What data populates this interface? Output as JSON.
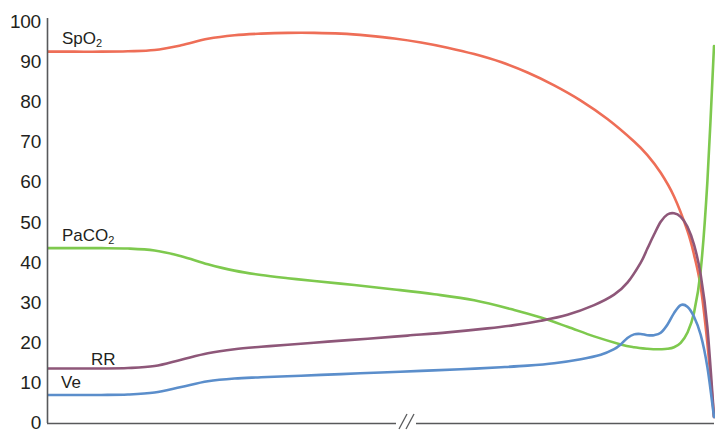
{
  "chart_data": {
    "type": "line",
    "title": "",
    "xlabel": "",
    "ylabel": "",
    "ylim": [
      0,
      100
    ],
    "xlim": [
      0,
      100
    ],
    "grid": false,
    "legend_position": "inline-curve-labels",
    "axis_break": {
      "present": true,
      "symbol": "//",
      "axis": "x",
      "x_position": 56
    },
    "y_ticks": [
      {
        "value": 100,
        "label": "100"
      },
      {
        "value": 90,
        "label": "90"
      },
      {
        "value": 80,
        "label": "80"
      },
      {
        "value": 70,
        "label": "70"
      },
      {
        "value": 60,
        "label": "60"
      },
      {
        "value": 50,
        "label": "50"
      },
      {
        "value": 40,
        "label": "40"
      },
      {
        "value": 30,
        "label": "30"
      },
      {
        "value": 20,
        "label": "20"
      },
      {
        "value": 10,
        "label": "10"
      },
      {
        "value": 0,
        "label": "0"
      }
    ],
    "x_ticks": [],
    "series": [
      {
        "name": "SpO2",
        "label": "SpO",
        "label_sub": "2",
        "color": "#ee6e57",
        "label_x": 62,
        "label_y": 30,
        "x": [
          0,
          4,
          8,
          12,
          16,
          20,
          24,
          28,
          32,
          36,
          40,
          44,
          48,
          52,
          56,
          60,
          64,
          68,
          72,
          76,
          80,
          84,
          88,
          90,
          92,
          94,
          96,
          97,
          98,
          99,
          100
        ],
        "y": [
          92.6,
          92.6,
          92.6,
          92.7,
          93.0,
          94.2,
          95.8,
          96.7,
          97.1,
          97.3,
          97.3,
          97.1,
          96.6,
          95.9,
          94.9,
          93.6,
          92.0,
          90.0,
          87.4,
          84.2,
          80.4,
          75.8,
          70.2,
          66.8,
          62.4,
          56.5,
          48.0,
          42.0,
          34.0,
          20.0,
          1.5
        ]
      },
      {
        "name": "PaCO2",
        "label": "PaCO",
        "label_sub": "2",
        "color": "#7ec94e",
        "label_x": 62,
        "label_y": 227,
        "x": [
          0,
          4,
          8,
          12,
          16,
          20,
          24,
          28,
          32,
          36,
          40,
          46,
          52,
          58,
          64,
          70,
          74,
          78,
          82,
          86,
          88,
          90,
          91,
          92,
          93,
          94,
          95,
          96,
          97,
          98,
          99,
          100
        ],
        "y": [
          43.6,
          43.6,
          43.6,
          43.5,
          43.0,
          41.6,
          39.6,
          38.0,
          36.9,
          36.1,
          35.4,
          34.4,
          33.3,
          32.1,
          30.6,
          28.2,
          26.3,
          24.0,
          21.6,
          19.6,
          18.9,
          18.5,
          18.4,
          18.4,
          18.5,
          18.9,
          20.0,
          22.5,
          27.5,
          38.0,
          60.0,
          94.0
        ]
      },
      {
        "name": "RR",
        "label": "RR",
        "label_sub": "",
        "color": "#8e5779",
        "label_x": 91,
        "label_y": 351,
        "x": [
          0,
          4,
          8,
          12,
          16,
          20,
          24,
          28,
          32,
          36,
          42,
          48,
          54,
          60,
          66,
          70,
          74,
          78,
          82,
          85,
          87,
          89,
          90,
          91,
          92,
          93,
          94,
          95,
          96,
          97,
          98,
          99,
          100
        ],
        "y": [
          13.6,
          13.6,
          13.6,
          13.7,
          14.2,
          15.8,
          17.4,
          18.4,
          19.0,
          19.5,
          20.3,
          21.0,
          21.8,
          22.6,
          23.6,
          24.4,
          25.5,
          27.0,
          29.4,
          32.0,
          35.0,
          40.0,
          43.5,
          47.0,
          50.2,
          52.0,
          52.3,
          51.4,
          49.0,
          44.5,
          37.0,
          24.0,
          1.5
        ]
      },
      {
        "name": "Ve",
        "label": "Ve",
        "label_sub": "",
        "color": "#5b8ecb",
        "label_x": 61,
        "label_y": 374,
        "x": [
          0,
          4,
          8,
          12,
          16,
          20,
          24,
          28,
          32,
          38,
          44,
          50,
          56,
          62,
          68,
          72,
          76,
          80,
          83,
          85,
          86,
          87,
          88,
          89,
          90,
          91,
          92,
          93,
          94,
          95,
          96,
          97,
          98,
          99,
          100
        ],
        "y": [
          7.0,
          7.0,
          7.0,
          7.1,
          7.6,
          9.0,
          10.4,
          11.1,
          11.4,
          11.8,
          12.2,
          12.6,
          13.0,
          13.4,
          13.9,
          14.3,
          14.9,
          15.9,
          17.0,
          18.4,
          19.6,
          21.2,
          22.1,
          22.2,
          21.9,
          21.9,
          22.5,
          24.5,
          27.4,
          29.4,
          29.0,
          26.5,
          22.0,
          14.0,
          1.5
        ]
      }
    ]
  },
  "axes": {
    "left_axis_color": "#58595b",
    "bottom_axis_color": "#58595b"
  }
}
